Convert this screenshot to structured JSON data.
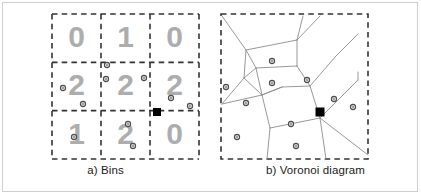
{
  "figure": {
    "width": 421,
    "height": 196,
    "background": "#ffffff",
    "border_color": "#cfcfcf"
  },
  "colors": {
    "grid_dash": "#333333",
    "bin_digit": "#adadad",
    "voronoi_edge": "#8c8c8c",
    "point_stroke": "#4d4d4d",
    "point_fill": "#d9d9d9",
    "query_point": "#000000",
    "caption_text": "#1a1a1a"
  },
  "panels": [
    {
      "id": "bins",
      "caption": "a) Bins",
      "grid": {
        "rows": 3,
        "cols": 3,
        "x": 52,
        "y": 14,
        "width": 147,
        "height": 145,
        "counts": [
          [
            0,
            1,
            0
          ],
          [
            2,
            2,
            2
          ],
          [
            1,
            2,
            0
          ]
        ]
      }
    },
    {
      "id": "voronoi",
      "caption": "b) Voronoi diagram",
      "box": {
        "x": 11,
        "y": 14,
        "width": 147,
        "height": 145
      }
    }
  ],
  "chart_data": {
    "type": "scatter",
    "title": "",
    "subtitle": "",
    "xlabel": "",
    "ylabel": "",
    "grid": true,
    "legend": null,
    "panels": [
      {
        "name": "a) Bins",
        "type": "scatter",
        "xlim": [
          0,
          147
        ],
        "ylim": [
          0,
          145
        ],
        "bin_grid": {
          "rows": 3,
          "cols": 3,
          "cell_width": 49,
          "cell_height": 48.33,
          "counts_row_major": [
            [
              0,
              1,
              0
            ],
            [
              2,
              2,
              2
            ],
            [
              1,
              2,
              0
            ]
          ],
          "labels": [
            "0",
            "1",
            "0",
            "2",
            "2",
            "2",
            "1",
            "2",
            "0"
          ],
          "total_points": 10
        },
        "points": [
          {
            "x": 107,
            "y": 65,
            "bin": "r1c1"
          },
          {
            "x": 106,
            "y": 79,
            "bin": "r1c1"
          },
          {
            "x": 63,
            "y": 88,
            "bin": "r1c0"
          },
          {
            "x": 83,
            "y": 104,
            "bin": "r1c0"
          },
          {
            "x": 144,
            "y": 78,
            "bin": "r1c1"
          },
          {
            "x": 171,
            "y": 98,
            "bin": "r1c2"
          },
          {
            "x": 190,
            "y": 106,
            "bin": "r1c2"
          },
          {
            "x": 74,
            "y": 137,
            "bin": "r2c0"
          },
          {
            "x": 128,
            "y": 124,
            "bin": "r2c1"
          },
          {
            "x": 133,
            "y": 146,
            "bin": "r2c1"
          }
        ],
        "query_point": {
          "x": 157,
          "y": 112,
          "marker": "filled-square"
        }
      },
      {
        "name": "b) Voronoi diagram",
        "type": "scatter",
        "xlim": [
          0,
          147
        ],
        "ylim": [
          0,
          145
        ],
        "points": [
          {
            "x": 272,
            "y": 61
          },
          {
            "x": 272,
            "y": 83
          },
          {
            "x": 226,
            "y": 87
          },
          {
            "x": 246,
            "y": 103
          },
          {
            "x": 307,
            "y": 80
          },
          {
            "x": 334,
            "y": 99
          },
          {
            "x": 353,
            "y": 107
          },
          {
            "x": 237,
            "y": 137
          },
          {
            "x": 291,
            "y": 124
          },
          {
            "x": 296,
            "y": 146
          }
        ],
        "query_point": {
          "x": 320,
          "y": 112,
          "marker": "filled-square"
        }
      }
    ]
  }
}
